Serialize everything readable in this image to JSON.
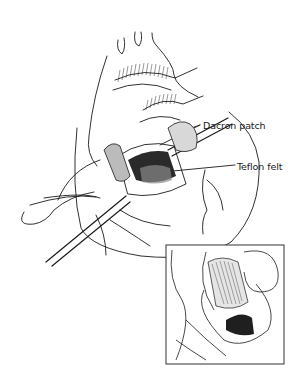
{
  "figure": {
    "type": "surgical-illustration",
    "labels": [
      {
        "id": "dacron",
        "text": "Dacron patch"
      },
      {
        "id": "teflon",
        "text": "Teflon felt"
      }
    ],
    "inset": {
      "present": true,
      "description": "detail view of patch sutured into incision"
    },
    "colors": {
      "line": "#1a1a1a",
      "background": "#ffffff",
      "shade": "#333333"
    }
  }
}
